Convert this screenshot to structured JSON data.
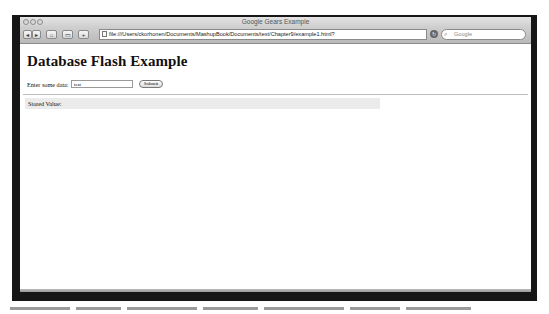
{
  "window": {
    "title": "Google Gears Example"
  },
  "toolbar": {
    "back_icon": "back-arrow-icon",
    "forward_icon": "forward-arrow-icon",
    "home_icon": "home-icon",
    "bookmarks_icon": "bookmarks-icon",
    "add_icon": "plus-icon",
    "url": "file:///Users/ckorhonen/Documents/MashupBook/Documents/text/Chapter9/example1.html?",
    "reload_icon": "reload-icon",
    "search_placeholder": "Google"
  },
  "page": {
    "heading": "Database Flash Example",
    "form_label": "Enter some data:",
    "input_value": "test",
    "submit_label": "Submit",
    "stored_label": "Stored Value:"
  },
  "colors": {
    "frame": "#161616",
    "stored_bg": "#ebebeb"
  }
}
